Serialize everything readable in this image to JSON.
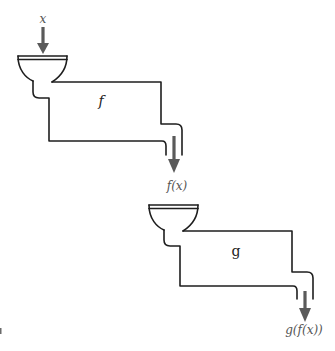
{
  "diagram": {
    "machines": [
      {
        "id": "machine-f",
        "function_label": "f",
        "input_label": "x",
        "output_label": "f(x)"
      },
      {
        "id": "machine-g",
        "function_label": "g",
        "input_label": "f(x)",
        "output_label": "g(f(x))"
      }
    ],
    "colors": {
      "pipe": "#1e1e1e",
      "arrow": "#5a5a5a",
      "label": "#555555",
      "background": "#ffffff"
    }
  }
}
